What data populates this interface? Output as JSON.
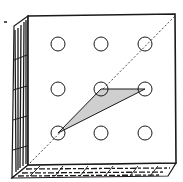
{
  "figure": {
    "grid": {
      "rows": 3,
      "cols": 3
    },
    "pegs": [
      {
        "cx": 58,
        "cy": 44
      },
      {
        "cx": 101,
        "cy": 44
      },
      {
        "cx": 145,
        "cy": 44
      },
      {
        "cx": 58,
        "cy": 89
      },
      {
        "cx": 101,
        "cy": 89
      },
      {
        "cx": 145,
        "cy": 89
      },
      {
        "cx": 58,
        "cy": 133
      },
      {
        "cx": 101,
        "cy": 133
      },
      {
        "cx": 145,
        "cy": 133
      }
    ],
    "peg_radius": 7,
    "triangle": {
      "points": "58,133 101,89 145,89",
      "fill": "#cfcfcf"
    },
    "diagonal": {
      "x1": 30,
      "y1": 163,
      "x2": 175,
      "y2": 16
    },
    "colors": {
      "ink": "#1a1a1a",
      "board": "#ffffff",
      "shade": "#cfcfcf"
    }
  }
}
